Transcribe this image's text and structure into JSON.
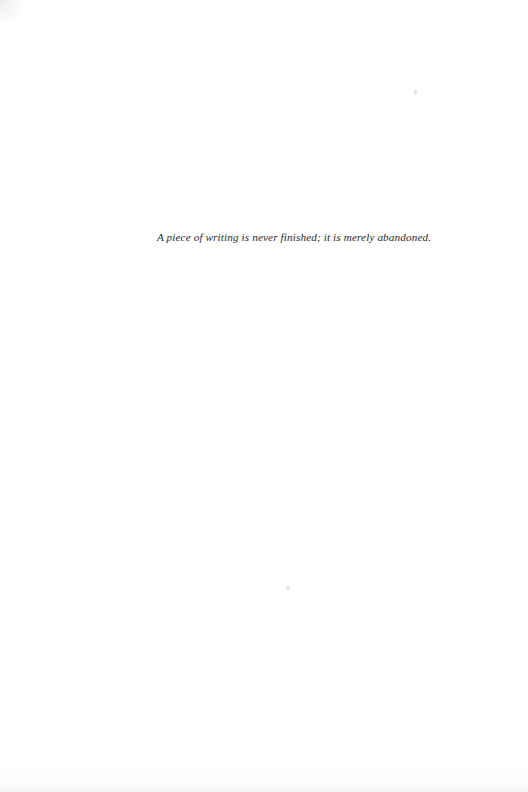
{
  "page": {
    "kind": "book-epigraph-page",
    "background_color": "#ffffff",
    "width": 528,
    "height": 792
  },
  "epigraph": {
    "text": "A piece of writing is never finished; it is merely abandoned.",
    "style": "italic-serif",
    "color": "#2a2a2a",
    "alignment": "center"
  },
  "artifacts": {
    "corner_tint": "",
    "bottom_smudge": "",
    "speck_upper": "",
    "speck_lower": ""
  }
}
